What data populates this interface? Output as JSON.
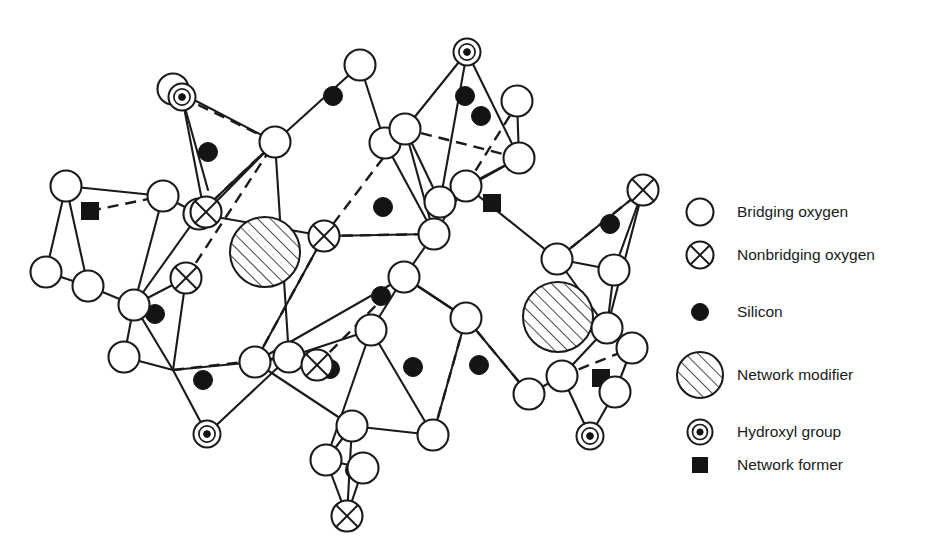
{
  "figure": {
    "background_color": "#ffffff",
    "stroke_color": "#1a1a1a"
  },
  "legend": {
    "items": [
      {
        "icon": "open-circle-icon",
        "label": "Bridging oxygen",
        "symbol": "bridging-oxygen"
      },
      {
        "icon": "crossed-circle-icon",
        "label": "Nonbridging oxygen",
        "symbol": "nonbridging-oxygen"
      },
      {
        "icon": "filled-circle-icon",
        "label": "Silicon",
        "symbol": "silicon"
      },
      {
        "icon": "hatched-circle-icon",
        "label": "Network modifier",
        "symbol": "network-modifier"
      },
      {
        "icon": "concentric-circle-icon",
        "label": "Hydroxyl group",
        "symbol": "hydroxyl-group"
      },
      {
        "icon": "filled-square-icon",
        "label": "Network former",
        "symbol": "network-former"
      }
    ],
    "icon_x": 700,
    "text_x": 737,
    "rows_y": [
      212,
      255,
      312,
      375,
      432,
      465
    ]
  },
  "network": {
    "bridging_oxygen": [
      [
        66,
        186
      ],
      [
        46,
        272
      ],
      [
        88,
        286
      ],
      [
        134,
        305
      ],
      [
        163,
        196
      ],
      [
        199,
        214
      ],
      [
        275,
        142
      ],
      [
        360,
        65
      ],
      [
        385,
        143
      ],
      [
        405,
        129
      ],
      [
        434,
        234
      ],
      [
        404,
        277
      ],
      [
        466,
        186
      ],
      [
        440,
        202
      ],
      [
        519,
        158
      ],
      [
        517,
        101
      ],
      [
        557,
        259
      ],
      [
        607,
        328
      ],
      [
        614,
        270
      ],
      [
        632,
        348
      ],
      [
        615,
        392
      ],
      [
        255,
        362
      ],
      [
        289,
        357
      ],
      [
        352,
        426
      ],
      [
        326,
        460
      ],
      [
        371,
        330
      ],
      [
        466,
        318
      ],
      [
        433,
        435
      ],
      [
        529,
        394
      ],
      [
        562,
        376
      ],
      [
        363,
        468
      ],
      [
        124,
        357
      ],
      [
        173,
        89
      ]
    ],
    "nonbridging_oxygen": [
      [
        206,
        212
      ],
      [
        186,
        278
      ],
      [
        324,
        236
      ],
      [
        643,
        190
      ],
      [
        347,
        516
      ],
      [
        317,
        365
      ]
    ],
    "silicon": [
      [
        208,
        152
      ],
      [
        155,
        314
      ],
      [
        203,
        380
      ],
      [
        330,
        369
      ],
      [
        383,
        207
      ],
      [
        381,
        296
      ],
      [
        355,
        470
      ],
      [
        465,
        96
      ],
      [
        413,
        367
      ],
      [
        479,
        365
      ],
      [
        610,
        224
      ],
      [
        333,
        96
      ],
      [
        481,
        116
      ]
    ],
    "hydroxyl_group": [
      [
        182,
        97
      ],
      [
        467,
        52
      ],
      [
        207,
        434
      ],
      [
        590,
        436
      ]
    ],
    "network_modifier": [
      [
        265,
        252
      ],
      [
        558,
        317
      ]
    ],
    "network_former": [
      [
        90,
        211
      ],
      [
        492,
        203
      ],
      [
        601,
        378
      ]
    ],
    "solid_bonds": [
      [
        [
          182,
          97
        ],
        [
          173,
          89
        ]
      ],
      [
        [
          182,
          97
        ],
        [
          208,
          190
        ]
      ],
      [
        [
          182,
          97
        ],
        [
          204,
          211
        ]
      ],
      [
        [
          173,
          89
        ],
        [
          275,
          142
        ]
      ],
      [
        [
          275,
          142
        ],
        [
          206,
          212
        ]
      ],
      [
        [
          275,
          142
        ],
        [
          199,
          214
        ]
      ],
      [
        [
          66,
          186
        ],
        [
          163,
          196
        ]
      ],
      [
        [
          66,
          186
        ],
        [
          46,
          272
        ]
      ],
      [
        [
          66,
          186
        ],
        [
          88,
          286
        ]
      ],
      [
        [
          46,
          272
        ],
        [
          88,
          286
        ]
      ],
      [
        [
          88,
          286
        ],
        [
          134,
          305
        ]
      ],
      [
        [
          134,
          305
        ],
        [
          163,
          196
        ]
      ],
      [
        [
          163,
          196
        ],
        [
          199,
          214
        ]
      ],
      [
        [
          199,
          214
        ],
        [
          206,
          212
        ]
      ],
      [
        [
          199,
          214
        ],
        [
          134,
          305
        ]
      ],
      [
        [
          275,
          142
        ],
        [
          360,
          65
        ]
      ],
      [
        [
          360,
          65
        ],
        [
          385,
          143
        ]
      ],
      [
        [
          385,
          143
        ],
        [
          405,
          129
        ]
      ],
      [
        [
          385,
          143
        ],
        [
          434,
          234
        ]
      ],
      [
        [
          405,
          129
        ],
        [
          434,
          234
        ]
      ],
      [
        [
          467,
          52
        ],
        [
          405,
          129
        ]
      ],
      [
        [
          467,
          52
        ],
        [
          440,
          202
        ]
      ],
      [
        [
          467,
          52
        ],
        [
          519,
          158
        ]
      ],
      [
        [
          519,
          158
        ],
        [
          517,
          101
        ]
      ],
      [
        [
          519,
          158
        ],
        [
          440,
          202
        ]
      ],
      [
        [
          440,
          202
        ],
        [
          405,
          129
        ]
      ],
      [
        [
          440,
          202
        ],
        [
          434,
          234
        ]
      ],
      [
        [
          434,
          234
        ],
        [
          324,
          236
        ]
      ],
      [
        [
          434,
          234
        ],
        [
          466,
          186
        ]
      ],
      [
        [
          466,
          186
        ],
        [
          519,
          158
        ]
      ],
      [
        [
          466,
          186
        ],
        [
          557,
          259
        ]
      ],
      [
        [
          557,
          259
        ],
        [
          643,
          190
        ]
      ],
      [
        [
          557,
          259
        ],
        [
          614,
          270
        ]
      ],
      [
        [
          557,
          259
        ],
        [
          607,
          328
        ]
      ],
      [
        [
          643,
          190
        ],
        [
          614,
          270
        ]
      ],
      [
        [
          643,
          190
        ],
        [
          607,
          328
        ]
      ],
      [
        [
          614,
          270
        ],
        [
          607,
          328
        ]
      ],
      [
        [
          607,
          328
        ],
        [
          632,
          348
        ]
      ],
      [
        [
          632,
          348
        ],
        [
          615,
          392
        ]
      ],
      [
        [
          607,
          328
        ],
        [
          562,
          376
        ]
      ],
      [
        [
          562,
          376
        ],
        [
          590,
          436
        ]
      ],
      [
        [
          615,
          392
        ],
        [
          590,
          436
        ]
      ],
      [
        [
          562,
          376
        ],
        [
          529,
          394
        ]
      ],
      [
        [
          529,
          394
        ],
        [
          466,
          318
        ]
      ],
      [
        [
          466,
          318
        ],
        [
          404,
          277
        ]
      ],
      [
        [
          404,
          277
        ],
        [
          434,
          234
        ]
      ],
      [
        [
          404,
          277
        ],
        [
          371,
          330
        ]
      ],
      [
        [
          371,
          330
        ],
        [
          433,
          435
        ]
      ],
      [
        [
          433,
          435
        ],
        [
          466,
          318
        ]
      ],
      [
        [
          371,
          330
        ],
        [
          289,
          357
        ]
      ],
      [
        [
          289,
          357
        ],
        [
          255,
          362
        ]
      ],
      [
        [
          255,
          362
        ],
        [
          352,
          426
        ]
      ],
      [
        [
          352,
          426
        ],
        [
          433,
          435
        ]
      ],
      [
        [
          352,
          426
        ],
        [
          326,
          460
        ]
      ],
      [
        [
          326,
          460
        ],
        [
          363,
          468
        ]
      ],
      [
        [
          363,
          468
        ],
        [
          347,
          516
        ]
      ],
      [
        [
          326,
          460
        ],
        [
          347,
          516
        ]
      ],
      [
        [
          352,
          426
        ],
        [
          347,
          516
        ]
      ],
      [
        [
          289,
          357
        ],
        [
          317,
          365
        ]
      ],
      [
        [
          255,
          362
        ],
        [
          404,
          277
        ]
      ],
      [
        [
          255,
          362
        ],
        [
          324,
          236
        ]
      ],
      [
        [
          324,
          236
        ],
        [
          199,
          214
        ]
      ],
      [
        [
          134,
          305
        ],
        [
          124,
          357
        ]
      ],
      [
        [
          124,
          357
        ],
        [
          173,
          370
        ]
      ],
      [
        [
          173,
          370
        ],
        [
          134,
          305
        ]
      ],
      [
        [
          173,
          370
        ],
        [
          186,
          278
        ]
      ],
      [
        [
          186,
          278
        ],
        [
          134,
          305
        ]
      ],
      [
        [
          173,
          370
        ],
        [
          255,
          362
        ]
      ],
      [
        [
          173,
          370
        ],
        [
          207,
          434
        ]
      ],
      [
        [
          207,
          434
        ],
        [
          289,
          357
        ]
      ],
      [
        [
          289,
          357
        ],
        [
          275,
          142
        ]
      ],
      [
        [
          371,
          330
        ],
        [
          326,
          460
        ]
      ],
      [
        [
          404,
          277
        ],
        [
          466,
          318
        ]
      ]
    ],
    "dashed_bonds": [
      [
        [
          182,
          97
        ],
        [
          275,
          142
        ]
      ],
      [
        [
          90,
          211
        ],
        [
          163,
          196
        ]
      ],
      [
        [
          199,
          214
        ],
        [
          275,
          142
        ]
      ],
      [
        [
          405,
          129
        ],
        [
          324,
          236
        ]
      ],
      [
        [
          519,
          158
        ],
        [
          405,
          129
        ]
      ],
      [
        [
          466,
          186
        ],
        [
          519,
          101
        ]
      ],
      [
        [
          324,
          236
        ],
        [
          434,
          234
        ]
      ],
      [
        [
          173,
          370
        ],
        [
          289,
          357
        ]
      ],
      [
        [
          466,
          318
        ],
        [
          529,
          394
        ]
      ],
      [
        [
          317,
          365
        ],
        [
          404,
          277
        ]
      ],
      [
        [
          562,
          376
        ],
        [
          632,
          348
        ]
      ],
      [
        [
          255,
          362
        ],
        [
          324,
          236
        ]
      ],
      [
        [
          186,
          278
        ],
        [
          275,
          142
        ]
      ],
      [
        [
          433,
          435
        ],
        [
          466,
          318
        ]
      ],
      [
        [
          557,
          259
        ],
        [
          643,
          190
        ]
      ]
    ]
  }
}
